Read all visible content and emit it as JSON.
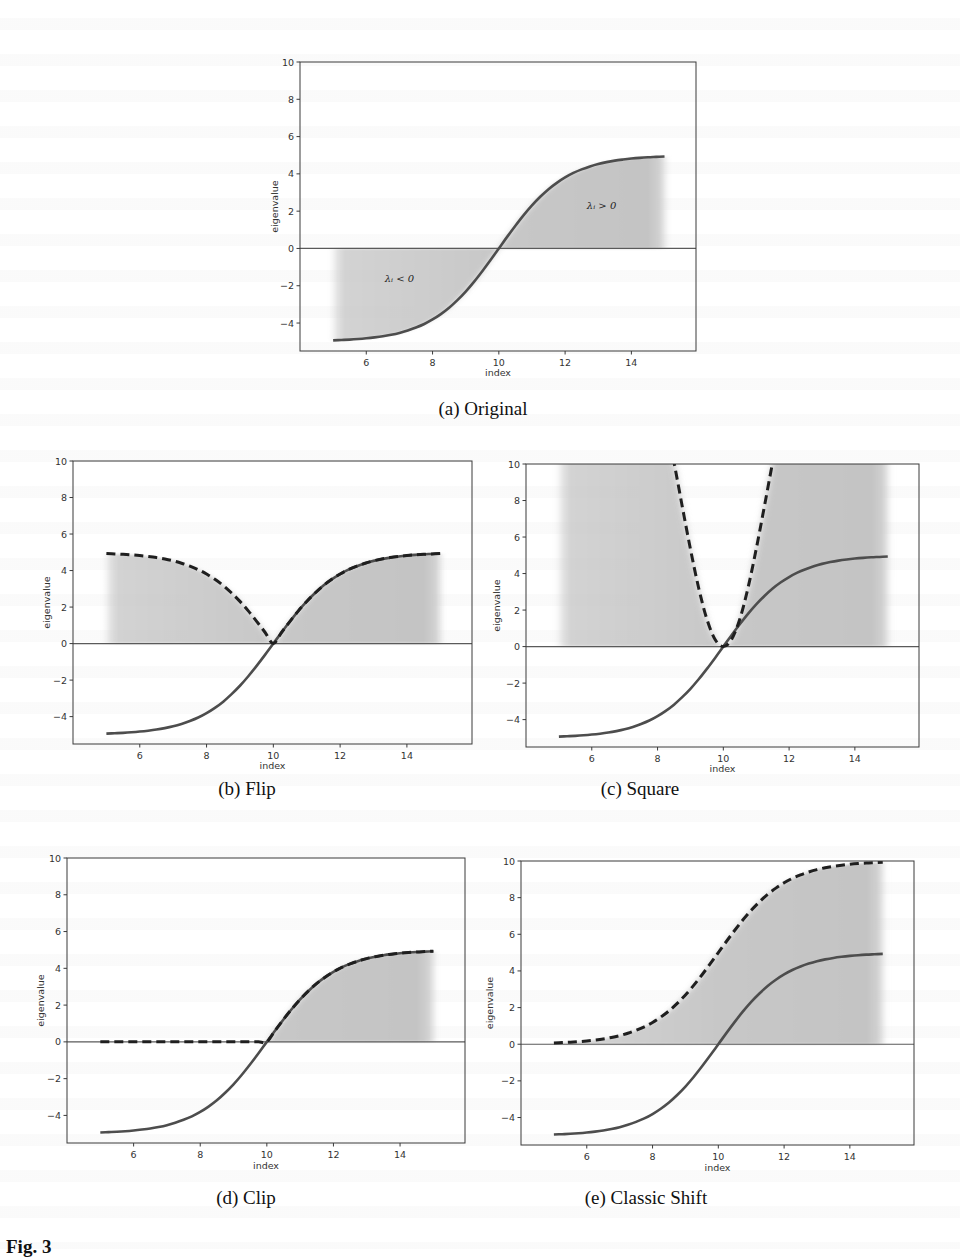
{
  "figure": {
    "fig_label": "Fig. 3",
    "captions": {
      "a": "(a) Original",
      "b": "(b) Flip",
      "c": "(c) Square",
      "d": "(d) Clip",
      "e": "(e) Classic Shift"
    }
  },
  "chart_data": [
    {
      "id": "a",
      "type": "line",
      "title": "(a) Original",
      "xlabel": "index",
      "ylabel": "eigenvalue",
      "xticks": [
        6,
        8,
        10,
        12,
        14
      ],
      "yticks": [
        -4,
        -2,
        0,
        2,
        4,
        6,
        8,
        10
      ],
      "xlim": [
        4.0,
        15.95
      ],
      "ylim": [
        -5.5,
        10
      ],
      "grid": false,
      "hline": 0,
      "annotations": [
        {
          "text": "λᵢ < 0",
          "x": 7.0,
          "y": -1.8
        },
        {
          "text": "λᵢ > 0",
          "x": 13.1,
          "y": 2.1
        }
      ],
      "fill": {
        "between": [
          "original",
          0
        ]
      },
      "series": [
        {
          "name": "original",
          "style": "solid",
          "ref": "original"
        }
      ]
    },
    {
      "id": "b",
      "type": "line",
      "title": "(b) Flip",
      "xlabel": "index",
      "ylabel": "eigenvalue",
      "xticks": [
        6,
        8,
        10,
        12,
        14
      ],
      "yticks": [
        -4,
        -2,
        0,
        2,
        4,
        6,
        8,
        10
      ],
      "xlim": [
        4.0,
        15.95
      ],
      "ylim": [
        -5.5,
        10
      ],
      "grid": false,
      "hline": 0,
      "annotations": [],
      "fill": {
        "between": [
          "flip",
          0
        ]
      },
      "series": [
        {
          "name": "original",
          "style": "solid",
          "ref": "original"
        },
        {
          "name": "flip",
          "style": "dashed",
          "ref": "flip"
        }
      ]
    },
    {
      "id": "c",
      "type": "line",
      "title": "(c) Square",
      "xlabel": "index",
      "ylabel": "eigenvalue",
      "xticks": [
        6,
        8,
        10,
        12,
        14
      ],
      "yticks": [
        -4,
        -2,
        0,
        2,
        4,
        6,
        8,
        10
      ],
      "xlim": [
        4.0,
        15.95
      ],
      "ylim": [
        -5.5,
        10
      ],
      "grid": false,
      "hline": 0,
      "annotations": [],
      "fill": {
        "between": [
          "square",
          0
        ]
      },
      "series": [
        {
          "name": "original",
          "style": "solid",
          "ref": "original"
        },
        {
          "name": "square",
          "style": "dashed",
          "ref": "square"
        }
      ]
    },
    {
      "id": "d",
      "type": "line",
      "title": "(d) Clip",
      "xlabel": "index",
      "ylabel": "eigenvalue",
      "xticks": [
        6,
        8,
        10,
        12,
        14
      ],
      "yticks": [
        -4,
        -2,
        0,
        2,
        4,
        6,
        8,
        10
      ],
      "xlim": [
        4.0,
        15.95
      ],
      "ylim": [
        -5.5,
        10
      ],
      "grid": false,
      "hline": 0,
      "annotations": [],
      "fill": {
        "between": [
          "clip",
          0
        ]
      },
      "series": [
        {
          "name": "original",
          "style": "solid",
          "ref": "original"
        },
        {
          "name": "clip",
          "style": "dashed",
          "ref": "clip"
        }
      ]
    },
    {
      "id": "e",
      "type": "line",
      "title": "(e) Classic Shift",
      "xlabel": "index",
      "ylabel": "eigenvalue",
      "xticks": [
        6,
        8,
        10,
        12,
        14
      ],
      "yticks": [
        -4,
        -2,
        0,
        2,
        4,
        6,
        8,
        10
      ],
      "xlim": [
        4.0,
        15.95
      ],
      "ylim": [
        -5.5,
        10
      ],
      "grid": false,
      "hline": 0,
      "annotations": [],
      "fill": {
        "between": [
          "shift",
          0
        ]
      },
      "series": [
        {
          "name": "original",
          "style": "solid",
          "ref": "original"
        },
        {
          "name": "shift",
          "style": "dashed",
          "ref": "shift"
        }
      ]
    }
  ],
  "curves": {
    "x": [
      5,
      5.25,
      5.5,
      5.75,
      6,
      6.25,
      6.5,
      6.75,
      7,
      7.25,
      7.5,
      7.75,
      8,
      8.25,
      8.5,
      8.75,
      9,
      9.25,
      9.5,
      9.75,
      10,
      10.25,
      10.5,
      10.75,
      11,
      11.25,
      11.5,
      11.75,
      12,
      12.25,
      12.5,
      12.75,
      13,
      13.25,
      13.5,
      13.75,
      14,
      14.25,
      14.5,
      14.75,
      15
    ],
    "original": [
      -4.93,
      -4.91,
      -4.89,
      -4.86,
      -4.82,
      -4.77,
      -4.71,
      -4.63,
      -4.53,
      -4.4,
      -4.24,
      -4.05,
      -3.81,
      -3.52,
      -3.18,
      -2.77,
      -2.31,
      -1.79,
      -1.22,
      -0.62,
      0,
      0.62,
      1.22,
      1.79,
      2.31,
      2.77,
      3.18,
      3.52,
      3.81,
      4.05,
      4.24,
      4.4,
      4.53,
      4.63,
      4.71,
      4.77,
      4.82,
      4.86,
      4.89,
      4.91,
      4.93
    ],
    "flip": [
      4.93,
      4.91,
      4.89,
      4.86,
      4.82,
      4.77,
      4.71,
      4.63,
      4.53,
      4.4,
      4.24,
      4.05,
      3.81,
      3.52,
      3.18,
      2.77,
      2.31,
      1.79,
      1.22,
      0.62,
      0,
      0.62,
      1.22,
      1.79,
      2.31,
      2.77,
      3.18,
      3.52,
      3.81,
      4.05,
      4.24,
      4.4,
      4.53,
      4.63,
      4.71,
      4.77,
      4.82,
      4.86,
      4.89,
      4.91,
      4.93
    ],
    "square": [
      24.3,
      24.1,
      23.9,
      23.6,
      23.2,
      22.8,
      22.2,
      21.4,
      20.5,
      19.4,
      18.0,
      16.4,
      14.5,
      12.4,
      10.1,
      7.69,
      5.34,
      3.21,
      1.5,
      0.39,
      0,
      0.39,
      1.5,
      3.21,
      5.34,
      7.69,
      10.1,
      12.4,
      14.5,
      16.4,
      18.0,
      19.4,
      20.5,
      21.4,
      22.2,
      22.8,
      23.2,
      23.6,
      23.9,
      24.1,
      24.3
    ],
    "clip": [
      0,
      0,
      0,
      0,
      0,
      0,
      0,
      0,
      0,
      0,
      0,
      0,
      0,
      0,
      0,
      0,
      0,
      0,
      0,
      0,
      0,
      0.62,
      1.22,
      1.79,
      2.31,
      2.77,
      3.18,
      3.52,
      3.81,
      4.05,
      4.24,
      4.4,
      4.53,
      4.63,
      4.71,
      4.77,
      4.82,
      4.86,
      4.89,
      4.91,
      4.93
    ],
    "shift": [
      0.07,
      0.09,
      0.11,
      0.14,
      0.18,
      0.23,
      0.29,
      0.37,
      0.47,
      0.6,
      0.76,
      0.95,
      1.19,
      1.48,
      1.82,
      2.23,
      2.69,
      3.21,
      3.78,
      4.38,
      5,
      5.62,
      6.22,
      6.79,
      7.31,
      7.77,
      8.18,
      8.52,
      8.81,
      9.05,
      9.24,
      9.4,
      9.53,
      9.63,
      9.71,
      9.77,
      9.82,
      9.86,
      9.89,
      9.91,
      9.93
    ]
  },
  "style": {
    "solid_color": "#4d4d4d",
    "dashed_color": "#1f1f1f",
    "fill_color": "#c4c4c4",
    "axis_color": "#3a3a3a",
    "zero_line_color": "#5a5a5a",
    "text_color": "#333333"
  }
}
